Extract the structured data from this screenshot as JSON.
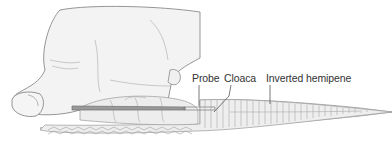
{
  "figure": {
    "labels": [
      {
        "id": "probe",
        "text": "Probe"
      },
      {
        "id": "cloaca",
        "text": "Cloaca"
      },
      {
        "id": "hemipene",
        "text": "Inverted hemipene"
      }
    ]
  },
  "colors": {
    "outline": "#8a8a8a",
    "fill_light": "#ececec",
    "probe": "#7a7a7a",
    "label_text": "#333333"
  }
}
